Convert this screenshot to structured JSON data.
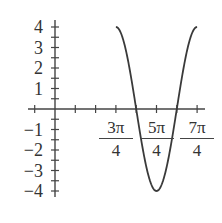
{
  "chart_data": {
    "type": "line",
    "title": "",
    "xlabel": "",
    "ylabel": "",
    "function": "y = 4cos(2(x - 3π/4))",
    "xlim": [
      -0.785,
      5.498
    ],
    "ylim": [
      -4,
      4
    ],
    "grid": false,
    "x_ticks_multiples_of_pi_over_4": [
      -1,
      0,
      1,
      2,
      3,
      4,
      5,
      6,
      7
    ],
    "x_tick_labels": [
      {
        "num": "3π",
        "den": "4",
        "value_over_pi_4": 3
      },
      {
        "num": "5π",
        "den": "4",
        "value_over_pi_4": 5
      },
      {
        "num": "7π",
        "den": "4",
        "value_over_pi_4": 7
      }
    ],
    "y_ticks_step": 0.5,
    "y_tick_labels": [
      "4",
      "3",
      "2",
      "1",
      "−1",
      "−2",
      "−3",
      "−4"
    ],
    "y_tick_values": [
      4,
      3,
      2,
      1,
      -1,
      -2,
      -3,
      -4
    ],
    "series": [
      {
        "name": "curve",
        "x_range_pi_over_4": [
          3,
          7
        ],
        "points": [
          {
            "x": "3π/4",
            "y": 4
          },
          {
            "x": "π",
            "y": 0
          },
          {
            "x": "5π/4",
            "y": -4
          },
          {
            "x": "3π/2",
            "y": 0
          },
          {
            "x": "7π/4",
            "y": 4
          }
        ]
      }
    ],
    "colors": {
      "axis": "#444444",
      "curve": "#3a3a3a",
      "text": "#333333"
    }
  }
}
